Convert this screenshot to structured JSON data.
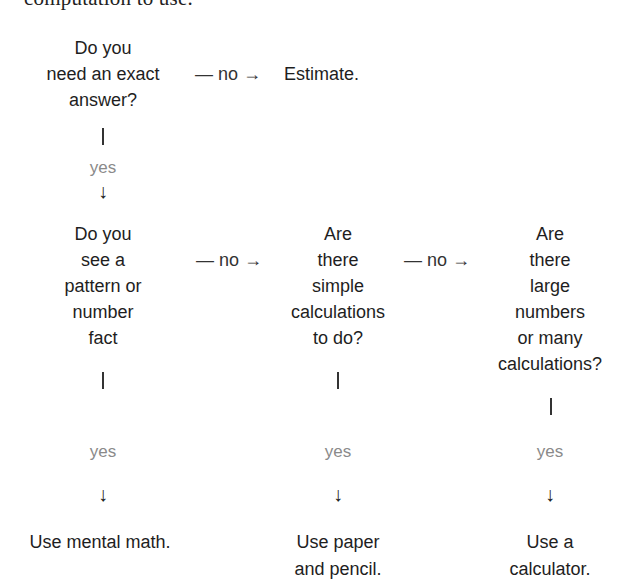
{
  "header_fragment": "computation to use.",
  "flowchart": {
    "q1": {
      "lines": [
        "Do you",
        "need an exact",
        "answer?"
      ]
    },
    "q1_no_edge": "— no →",
    "q1_no_result": "Estimate.",
    "q1_yes_label": "yes",
    "q2": {
      "lines": [
        "Do you",
        "see a",
        "pattern or",
        "number",
        "fact"
      ]
    },
    "q2_no_edge": "— no →",
    "q2_yes_label": "yes",
    "q2_result": {
      "lines": [
        "Use mental math."
      ]
    },
    "q3": {
      "lines": [
        "Are",
        "there",
        "simple",
        "calculations",
        "to do?"
      ]
    },
    "q3_no_edge": "— no →",
    "q3_yes_label": "yes",
    "q3_result": {
      "lines": [
        "Use paper",
        "and pencil."
      ]
    },
    "q4": {
      "lines": [
        "Are",
        "there",
        "large",
        "numbers",
        "or many",
        "calculations?"
      ]
    },
    "q4_yes_label": "yes",
    "q4_result": {
      "lines": [
        "Use a",
        "calculator."
      ]
    },
    "down_arrow": "↓"
  }
}
